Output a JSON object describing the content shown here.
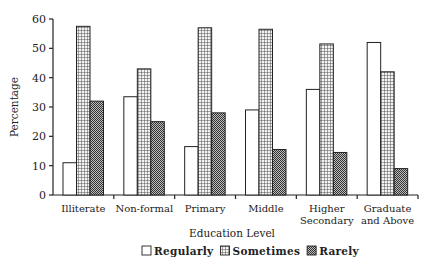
{
  "chart_data": {
    "type": "bar",
    "title": "",
    "xlabel": "Education Level",
    "ylabel": "Percentage",
    "ylim": [
      0,
      60
    ],
    "yticks": [
      0,
      10,
      20,
      30,
      40,
      50,
      60
    ],
    "grid": false,
    "legend_position": "bottom",
    "categories": [
      "Illiterate",
      "Non-formal",
      "Primary",
      "Middle",
      "Higher Secondary",
      "Graduate and Above"
    ],
    "category_lines": [
      [
        "Illiterate"
      ],
      [
        "Non-formal"
      ],
      [
        "Primary"
      ],
      [
        "Middle"
      ],
      [
        "Higher",
        "Secondary"
      ],
      [
        "Graduate",
        "and Above"
      ]
    ],
    "series": [
      {
        "name": "Regularly",
        "pattern": "blank",
        "values": [
          11,
          33.5,
          16.5,
          29,
          36,
          52
        ]
      },
      {
        "name": "Sometimes",
        "pattern": "grid",
        "values": [
          57.5,
          43,
          57,
          56.5,
          51.5,
          42
        ]
      },
      {
        "name": "Rarely",
        "pattern": "dense-check",
        "values": [
          32,
          25,
          28,
          15.5,
          14.5,
          9
        ]
      }
    ]
  },
  "colors": {
    "axis": "#222222",
    "bar_outline": "#222222",
    "regularly_fill": "#ffffff",
    "sometimes_fill": "#d8d8d8",
    "rarely_fill": "#8a8a8a"
  }
}
